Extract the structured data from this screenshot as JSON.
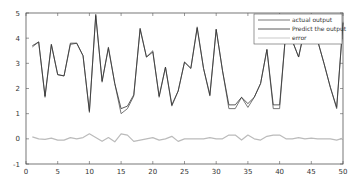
{
  "chart_data": {
    "type": "line",
    "title": "",
    "xlabel": "",
    "ylabel": "",
    "xlim": [
      0,
      50
    ],
    "ylim": [
      -1,
      5
    ],
    "xticks": [
      0,
      5,
      10,
      15,
      20,
      25,
      30,
      35,
      40,
      45,
      50
    ],
    "yticks": [
      -1,
      0,
      1,
      2,
      3,
      4,
      5
    ],
    "grid": false,
    "legend_position": "upper right",
    "x": [
      1,
      2,
      3,
      4,
      5,
      6,
      7,
      8,
      9,
      10,
      11,
      12,
      13,
      14,
      15,
      16,
      17,
      18,
      19,
      20,
      21,
      22,
      23,
      24,
      25,
      26,
      27,
      28,
      29,
      30,
      31,
      32,
      33,
      34,
      35,
      36,
      37,
      38,
      39,
      40,
      41,
      42,
      43,
      44,
      45,
      46,
      47,
      48,
      49,
      50
    ],
    "series": [
      {
        "name": "actual output",
        "color": "#555555",
        "values": [
          3.65,
          3.85,
          1.65,
          3.75,
          2.55,
          2.5,
          3.75,
          3.8,
          3.3,
          1.05,
          4.95,
          2.25,
          3.65,
          2.2,
          1.0,
          1.2,
          1.7,
          4.4,
          3.25,
          3.5,
          1.65,
          2.85,
          1.3,
          1.9,
          3.05,
          2.8,
          4.45,
          2.8,
          1.7,
          4.35,
          2.7,
          1.2,
          1.2,
          1.65,
          1.25,
          1.65,
          2.2,
          3.55,
          1.2,
          1.2,
          4.35,
          3.9,
          3.25,
          4.45,
          4.5,
          3.9,
          3.0,
          2.05,
          1.2,
          4.65
        ]
      },
      {
        "name": "Predict the output",
        "color": "#333333",
        "values": [
          3.7,
          3.85,
          1.7,
          3.75,
          2.55,
          2.5,
          3.8,
          3.8,
          3.3,
          1.1,
          4.9,
          2.3,
          3.6,
          2.2,
          1.2,
          1.3,
          1.75,
          4.35,
          3.25,
          3.45,
          1.7,
          2.85,
          1.35,
          1.9,
          3.05,
          2.8,
          4.4,
          2.8,
          1.75,
          4.35,
          2.7,
          1.35,
          1.35,
          1.65,
          1.4,
          1.65,
          2.2,
          3.55,
          1.35,
          1.35,
          4.3,
          3.9,
          3.25,
          4.4,
          4.45,
          3.9,
          3.0,
          2.05,
          1.25,
          4.6
        ]
      },
      {
        "name": "error",
        "color": "#bbbbbb",
        "values": [
          0.08,
          0.0,
          -0.02,
          0.03,
          -0.05,
          -0.05,
          0.05,
          0.0,
          0.05,
          0.2,
          0.05,
          -0.1,
          0.05,
          -0.12,
          0.2,
          0.15,
          -0.1,
          -0.05,
          0.0,
          0.05,
          -0.05,
          0.0,
          0.1,
          -0.1,
          0.0,
          0.0,
          0.0,
          0.0,
          0.05,
          0.0,
          0.0,
          0.15,
          0.15,
          -0.05,
          0.15,
          0.0,
          -0.05,
          0.1,
          0.15,
          0.15,
          0.0,
          0.0,
          0.05,
          0.0,
          0.03,
          0.0,
          0.0,
          0.0,
          -0.05,
          0.03
        ]
      }
    ]
  },
  "legend": {
    "items": [
      {
        "label": "actual output",
        "color": "#555555"
      },
      {
        "label": "Predict the output",
        "color": "#333333"
      },
      {
        "label": "error",
        "color": "#bbbbbb"
      }
    ]
  },
  "axes": {
    "x_tick_labels": [
      "0",
      "5",
      "10",
      "15",
      "20",
      "25",
      "30",
      "35",
      "40",
      "45",
      "50"
    ],
    "y_tick_labels": [
      "-1",
      "0",
      "1",
      "2",
      "3",
      "4",
      "5"
    ]
  }
}
